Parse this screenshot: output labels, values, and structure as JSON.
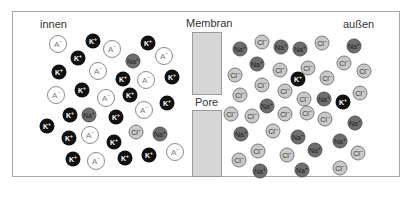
{
  "labels": {
    "inside": "innen",
    "outside": "außen",
    "membrane": "Membran",
    "pore": "Pore"
  },
  "ion_types": {
    "A": {
      "symbol": "A",
      "charge": "–",
      "fill": "#ffffff"
    },
    "K": {
      "symbol": "K",
      "charge": "+",
      "fill": "#111111"
    },
    "Na": {
      "symbol": "Na",
      "charge": "+",
      "fill": "#6e6e6e"
    },
    "Cl": {
      "symbol": "Cl",
      "charge": "–",
      "fill": "#c9c9c9"
    }
  },
  "colors": {
    "frame": "#a8a8a8",
    "membrane": "#d6d6d6"
  },
  "ions_inside": [
    {
      "t": "A",
      "x": 58,
      "y": 44
    },
    {
      "t": "K",
      "x": 93,
      "y": 41
    },
    {
      "t": "A",
      "x": 112,
      "y": 49
    },
    {
      "t": "K",
      "x": 148,
      "y": 43
    },
    {
      "t": "A",
      "x": 164,
      "y": 56
    },
    {
      "t": "K",
      "x": 78,
      "y": 58
    },
    {
      "t": "Na",
      "x": 133,
      "y": 61
    },
    {
      "t": "K",
      "x": 59,
      "y": 72
    },
    {
      "t": "A",
      "x": 98,
      "y": 71
    },
    {
      "t": "K",
      "x": 123,
      "y": 79
    },
    {
      "t": "A",
      "x": 146,
      "y": 80
    },
    {
      "t": "K",
      "x": 172,
      "y": 77
    },
    {
      "t": "A",
      "x": 56,
      "y": 95
    },
    {
      "t": "K",
      "x": 82,
      "y": 90
    },
    {
      "t": "A",
      "x": 106,
      "y": 98
    },
    {
      "t": "K",
      "x": 130,
      "y": 95
    },
    {
      "t": "A",
      "x": 144,
      "y": 110
    },
    {
      "t": "K",
      "x": 167,
      "y": 103
    },
    {
      "t": "Na",
      "x": 89,
      "y": 115
    },
    {
      "t": "K",
      "x": 116,
      "y": 117
    },
    {
      "t": "K",
      "x": 70,
      "y": 115
    },
    {
      "t": "K",
      "x": 47,
      "y": 126
    },
    {
      "t": "K",
      "x": 69,
      "y": 138
    },
    {
      "t": "A",
      "x": 90,
      "y": 135
    },
    {
      "t": "K",
      "x": 114,
      "y": 142
    },
    {
      "t": "Cl",
      "x": 136,
      "y": 132
    },
    {
      "t": "Na",
      "x": 160,
      "y": 134
    },
    {
      "t": "K",
      "x": 73,
      "y": 159
    },
    {
      "t": "A",
      "x": 96,
      "y": 161
    },
    {
      "t": "K",
      "x": 125,
      "y": 158
    },
    {
      "t": "K",
      "x": 149,
      "y": 155
    },
    {
      "t": "A",
      "x": 175,
      "y": 152
    }
  ],
  "ions_outside": [
    {
      "t": "Na",
      "x": 240,
      "y": 49
    },
    {
      "t": "Cl",
      "x": 262,
      "y": 42
    },
    {
      "t": "Na",
      "x": 281,
      "y": 47
    },
    {
      "t": "Na",
      "x": 300,
      "y": 49
    },
    {
      "t": "Cl",
      "x": 322,
      "y": 43
    },
    {
      "t": "Na",
      "x": 354,
      "y": 46
    },
    {
      "t": "Na",
      "x": 257,
      "y": 64
    },
    {
      "t": "Cl",
      "x": 235,
      "y": 75
    },
    {
      "t": "Cl",
      "x": 280,
      "y": 70
    },
    {
      "t": "Cl",
      "x": 308,
      "y": 68
    },
    {
      "t": "Cl",
      "x": 344,
      "y": 63
    },
    {
      "t": "Cl",
      "x": 364,
      "y": 71
    },
    {
      "t": "K",
      "x": 298,
      "y": 79
    },
    {
      "t": "Cl",
      "x": 327,
      "y": 78
    },
    {
      "t": "Cl",
      "x": 262,
      "y": 85
    },
    {
      "t": "Cl",
      "x": 285,
      "y": 91
    },
    {
      "t": "Cl",
      "x": 240,
      "y": 95
    },
    {
      "t": "Cl",
      "x": 304,
      "y": 99
    },
    {
      "t": "Na",
      "x": 324,
      "y": 99
    },
    {
      "t": "K",
      "x": 343,
      "y": 102
    },
    {
      "t": "Cl",
      "x": 360,
      "y": 93
    },
    {
      "t": "Na",
      "x": 267,
      "y": 106
    },
    {
      "t": "Cl",
      "x": 231,
      "y": 114
    },
    {
      "t": "Cl",
      "x": 252,
      "y": 116
    },
    {
      "t": "Cl",
      "x": 285,
      "y": 114
    },
    {
      "t": "Cl",
      "x": 307,
      "y": 113
    },
    {
      "t": "Cl",
      "x": 325,
      "y": 119
    },
    {
      "t": "Na",
      "x": 355,
      "y": 123
    },
    {
      "t": "Na",
      "x": 241,
      "y": 134
    },
    {
      "t": "Cl",
      "x": 273,
      "y": 131
    },
    {
      "t": "Na",
      "x": 298,
      "y": 137
    },
    {
      "t": "Na",
      "x": 340,
      "y": 141
    },
    {
      "t": "Na",
      "x": 315,
      "y": 150
    },
    {
      "t": "Cl",
      "x": 258,
      "y": 151
    },
    {
      "t": "Cl",
      "x": 287,
      "y": 155
    },
    {
      "t": "Cl",
      "x": 358,
      "y": 153
    },
    {
      "t": "Cl",
      "x": 239,
      "y": 160
    },
    {
      "t": "Na",
      "x": 260,
      "y": 171
    },
    {
      "t": "Na",
      "x": 302,
      "y": 170
    },
    {
      "t": "Cl",
      "x": 340,
      "y": 168
    }
  ]
}
